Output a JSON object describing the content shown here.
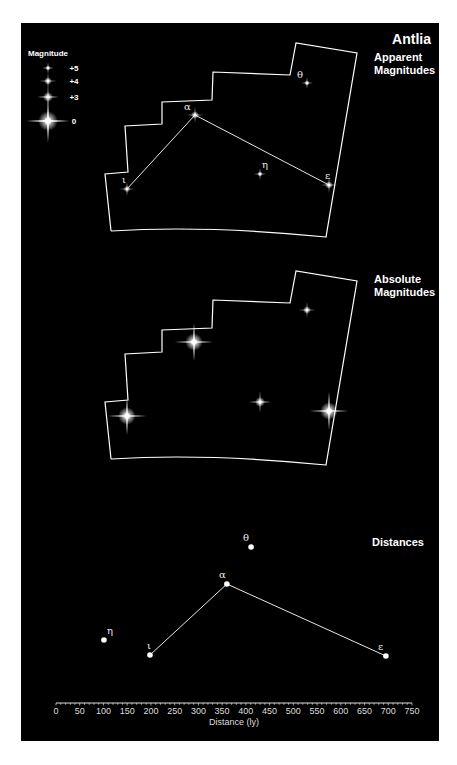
{
  "title": "Antlia",
  "sections": {
    "apparent": {
      "label_line1": "Apparent",
      "label_line2": "Magnitudes"
    },
    "absolute": {
      "label_line1": "Absolute",
      "label_line2": "Magnitudes"
    },
    "distances": {
      "label": "Distances"
    }
  },
  "legend": {
    "title": "Magnitude",
    "items": [
      {
        "label": "+5",
        "size": 2.5,
        "y": 68
      },
      {
        "label": "+4",
        "size": 3.5,
        "y": 81
      },
      {
        "label": "+3",
        "size": 4.5,
        "y": 97
      },
      {
        "label": "0",
        "size": 9,
        "y": 121
      }
    ]
  },
  "stars": [
    {
      "name": "alpha",
      "glyph": "α",
      "apparent": [
        195,
        115
      ],
      "absolute": [
        194,
        342
      ],
      "abs_size": 8,
      "app_size": 3.5,
      "distance_ly": 360,
      "dist_y": 584,
      "label_dx": -11,
      "label_dy": -5
    },
    {
      "name": "epsilon",
      "glyph": "ε",
      "apparent": [
        329,
        185
      ],
      "absolute": [
        329,
        411
      ],
      "abs_size": 8,
      "app_size": 3.5,
      "distance_ly": 695,
      "dist_y": 656,
      "label_dx": -4,
      "label_dy": -6
    },
    {
      "name": "eta",
      "glyph": "η",
      "apparent": [
        260,
        174
      ],
      "absolute": [
        260,
        402
      ],
      "abs_size": 4.5,
      "app_size": 2.5,
      "distance_ly": 101,
      "dist_y": 640,
      "label_dx": 2,
      "label_dy": -6
    },
    {
      "name": "theta",
      "glyph": "θ",
      "apparent": [
        307,
        83
      ],
      "absolute": [
        307,
        310
      ],
      "abs_size": 3.5,
      "app_size": 2.5,
      "distance_ly": 411,
      "dist_y": 547,
      "label_dx": -10,
      "label_dy": -5
    },
    {
      "name": "iota",
      "glyph": "ι",
      "apparent": [
        127,
        189
      ],
      "absolute": [
        127,
        416
      ],
      "abs_size": 8,
      "app_size": 3,
      "distance_ly": 198,
      "dist_y": 655,
      "label_dx": -5,
      "label_dy": -6
    }
  ],
  "lines": [
    [
      "iota",
      "alpha"
    ],
    [
      "alpha",
      "epsilon"
    ]
  ],
  "boundary": {
    "points": [
      [
        111,
        231
      ],
      [
        105,
        174
      ],
      [
        128,
        172
      ],
      [
        125,
        126
      ],
      [
        162,
        124
      ],
      [
        162,
        102
      ],
      [
        212,
        100
      ],
      [
        213,
        72
      ],
      [
        290,
        75
      ],
      [
        296,
        43
      ],
      [
        357,
        53
      ],
      [
        326,
        237
      ]
    ],
    "offset_absolute": 228
  },
  "axis": {
    "title": "Distance (ly)",
    "min": 0,
    "max": 750,
    "major_step": 50,
    "minor_step": 10,
    "x0": 56,
    "x1": 412,
    "y": 703,
    "tick_labels": [
      "0",
      "50",
      "100",
      "150",
      "200",
      "250",
      "300",
      "350",
      "400",
      "450",
      "500",
      "550",
      "600",
      "650",
      "700",
      "750"
    ]
  },
  "chart_data": {
    "type": "scatter",
    "title": "Antlia",
    "xlabel": "Distance (ly)",
    "xlim": [
      0,
      750
    ],
    "points": [
      {
        "label": "η",
        "x": 101
      },
      {
        "label": "ι",
        "x": 198
      },
      {
        "label": "α",
        "x": 360
      },
      {
        "label": "θ",
        "x": 411
      },
      {
        "label": "ε",
        "x": 695
      }
    ]
  }
}
